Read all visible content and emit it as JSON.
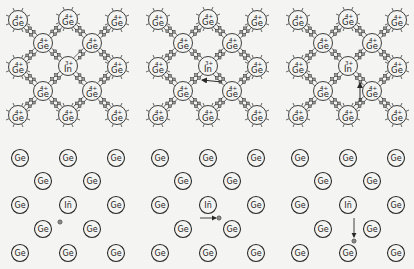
{
  "figure": {
    "colors": {
      "background": "#f4f4f2",
      "ink": "#2a2a2a",
      "bond_electron_fill": "#9a9a9a"
    },
    "host_atom": {
      "symbol": "Ge",
      "charge": "4+"
    },
    "dopant_atom": {
      "symbol": "In",
      "charge": "3+",
      "ion_label": "In̄"
    },
    "hole_symbol": "⊕",
    "panel_offsets_x": [
      0,
      140,
      280
    ],
    "lattice_panels": [
      {
        "name": "stage-1",
        "hole": "near-bond-In-lowerleft",
        "arrow": null
      },
      {
        "name": "stage-2",
        "hole": "moved-left",
        "arrow": {
          "direction": "left",
          "from": [
            82,
            82
          ],
          "to": [
            62,
            80
          ]
        }
      },
      {
        "name": "stage-3",
        "hole": "moved-down",
        "arrow": {
          "direction": "up",
          "from": [
            80,
            102
          ],
          "to": [
            80,
            83
          ]
        }
      }
    ],
    "ion_panels": [
      {
        "name": "stage-1",
        "hole_pos": [
          60,
          222
        ],
        "arrow": null
      },
      {
        "name": "stage-2",
        "hole_pos": [
          79,
          218
        ],
        "arrow": {
          "from": [
            60,
            218
          ],
          "to": [
            76,
            218
          ]
        }
      },
      {
        "name": "stage-3",
        "hole_pos": [
          74,
          241
        ],
        "arrow": {
          "from": [
            74,
            218
          ],
          "to": [
            74,
            237
          ]
        }
      }
    ],
    "top_atoms": [
      {
        "x": 18,
        "y": 20,
        "type": "Ge"
      },
      {
        "x": 68,
        "y": 19,
        "type": "Ge"
      },
      {
        "x": 117,
        "y": 20,
        "type": "Ge"
      },
      {
        "x": 43,
        "y": 43,
        "type": "Ge"
      },
      {
        "x": 92,
        "y": 43,
        "type": "Ge"
      },
      {
        "x": 18,
        "y": 67,
        "type": "Ge"
      },
      {
        "x": 68,
        "y": 66,
        "type": "In"
      },
      {
        "x": 117,
        "y": 67,
        "type": "Ge"
      },
      {
        "x": 43,
        "y": 91,
        "type": "Ge"
      },
      {
        "x": 92,
        "y": 91,
        "type": "Ge"
      },
      {
        "x": 18,
        "y": 115,
        "type": "Ge"
      },
      {
        "x": 68,
        "y": 115,
        "type": "Ge"
      },
      {
        "x": 117,
        "y": 115,
        "type": "Ge"
      }
    ],
    "bottom_atoms": [
      {
        "x": 20,
        "y": 158,
        "type": "Ge"
      },
      {
        "x": 68,
        "y": 158,
        "type": "Ge"
      },
      {
        "x": 116,
        "y": 158,
        "type": "Ge"
      },
      {
        "x": 43,
        "y": 181,
        "type": "Ge"
      },
      {
        "x": 92,
        "y": 181,
        "type": "Ge"
      },
      {
        "x": 20,
        "y": 205,
        "type": "Ge"
      },
      {
        "x": 68,
        "y": 205,
        "type": "In"
      },
      {
        "x": 116,
        "y": 205,
        "type": "Ge"
      },
      {
        "x": 43,
        "y": 229,
        "type": "Ge"
      },
      {
        "x": 92,
        "y": 229,
        "type": "Ge"
      },
      {
        "x": 20,
        "y": 253,
        "type": "Ge"
      },
      {
        "x": 68,
        "y": 253,
        "type": "Ge"
      },
      {
        "x": 116,
        "y": 253,
        "type": "Ge"
      }
    ]
  }
}
